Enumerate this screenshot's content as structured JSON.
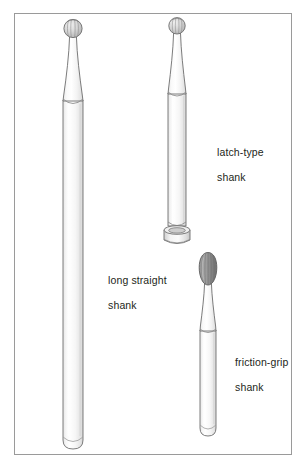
{
  "figure": {
    "background_color": "#ffffff",
    "frame": {
      "name": "figure-border",
      "x": 14,
      "y": 13,
      "width": 278,
      "height": 442,
      "stroke_color": "#9a9a9a",
      "stroke_width": 1
    },
    "labels": [
      {
        "id": "latch-type",
        "line1": "latch-type",
        "line2": "shank",
        "x": 205,
        "y": 133
      },
      {
        "id": "long-straight",
        "line1": "long straight",
        "line2": "shank",
        "x": 96,
        "y": 261
      },
      {
        "id": "friction-grip",
        "line1": "friction-grip",
        "line2": "shank",
        "x": 223,
        "y": 343
      }
    ],
    "burs": [
      {
        "id": "long-straight-shank",
        "name": "long-straight-shank-bur",
        "head_shape": "round-ball",
        "head_color": "#c9c9c9",
        "shank_color": "#f4f4f4",
        "outline_color": "#6d6d6d",
        "head_center_x": 73,
        "head_center_y": 29,
        "head_radius": 9,
        "shank_top_y": 38,
        "shank_bottom_y": 448,
        "shank_left_x": 63,
        "shank_right_x": 83
      },
      {
        "id": "latch-type-shank",
        "name": "latch-type-shank-bur",
        "head_shape": "round-ball",
        "head_color": "#c9c9c9",
        "shank_color": "#f4f4f4",
        "outline_color": "#6d6d6d",
        "head_center_x": 177,
        "head_center_y": 26,
        "head_radius": 8,
        "shank_top_y": 34,
        "shank_bottom_y": 226,
        "shank_left_x": 168,
        "shank_right_x": 186,
        "end_feature": "notched-collar"
      },
      {
        "id": "friction-grip-shank",
        "name": "friction-grip-shank-bur",
        "head_shape": "pear-oval",
        "head_color": "#8c8c8c",
        "shank_color": "#f4f4f4",
        "outline_color": "#6d6d6d",
        "head_center_x": 208,
        "head_center_y": 269,
        "head_rx": 8,
        "head_ry": 16,
        "shank_top_y": 285,
        "shank_bottom_y": 436,
        "shank_left_x": 199,
        "shank_right_x": 217,
        "end_feature": "rounded"
      }
    ],
    "colors": {
      "outline": "#6d6d6d",
      "frame": "#9a9a9a",
      "text": "#231f20",
      "metal_light": "#fbfbfb",
      "metal_mid": "#e8e8e8",
      "metal_shadow": "#cfcfcf",
      "head_dark": "#8c8c8c"
    }
  }
}
